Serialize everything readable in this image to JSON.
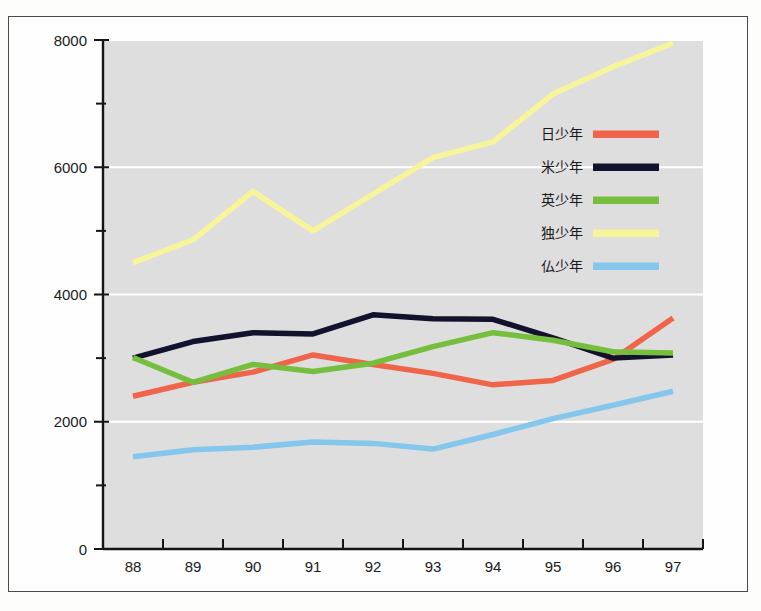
{
  "chart_data": {
    "type": "line",
    "title": "",
    "subtitle": "",
    "xlabel": "",
    "ylabel": "",
    "xlim": [
      87.5,
      97.5
    ],
    "ylim": [
      0,
      8000
    ],
    "x": [
      88,
      89,
      90,
      91,
      92,
      93,
      94,
      95,
      96,
      97
    ],
    "categories": [
      "88",
      "89",
      "90",
      "91",
      "92",
      "93",
      "94",
      "95",
      "96",
      "97"
    ],
    "y_ticks_major": [
      0,
      2000,
      4000,
      6000,
      8000
    ],
    "y_ticks_major_labels": [
      "0",
      "2000",
      "4000",
      "6000",
      "8000"
    ],
    "y_ticks_minor": [
      1000,
      3000,
      5000,
      7000
    ],
    "grid": "horizontal-major-white",
    "legend_position": "right-inside",
    "plot_background": "#dedede",
    "series": [
      {
        "name": "日少年",
        "color": "#f0654a",
        "values": [
          2400,
          2620,
          2780,
          3050,
          2900,
          2760,
          2580,
          2650,
          2980,
          3630
        ]
      },
      {
        "name": "米少年",
        "color": "#12112e",
        "values": [
          3000,
          3260,
          3400,
          3380,
          3680,
          3620,
          3610,
          3320,
          3000,
          3050
        ]
      },
      {
        "name": "英少年",
        "color": "#76bf3e",
        "values": [
          3010,
          2620,
          2900,
          2790,
          2920,
          3180,
          3400,
          3280,
          3100,
          3080
        ]
      },
      {
        "name": "独少年",
        "color": "#f7f49a",
        "values": [
          4500,
          4860,
          5620,
          5000,
          5580,
          6150,
          6400,
          7150,
          7580,
          7950
        ]
      },
      {
        "name": "仏少年",
        "color": "#85c6ed",
        "values": [
          1450,
          1560,
          1600,
          1680,
          1660,
          1570,
          1800,
          2050,
          2260,
          2480
        ]
      }
    ]
  },
  "legend": {
    "entries": [
      {
        "label": "日少年",
        "color": "#f0654a"
      },
      {
        "label": "米少年",
        "color": "#12112e"
      },
      {
        "label": "英少年",
        "color": "#76bf3e"
      },
      {
        "label": "独少年",
        "color": "#f7f49a"
      },
      {
        "label": "仏少年",
        "color": "#85c6ed"
      }
    ]
  },
  "colors": {
    "plot_bg": "#dedede",
    "page_bg": "#fdfdfc",
    "frame_border": "#4a4a4a",
    "axis": "#151515",
    "gridline": "#ffffff"
  }
}
